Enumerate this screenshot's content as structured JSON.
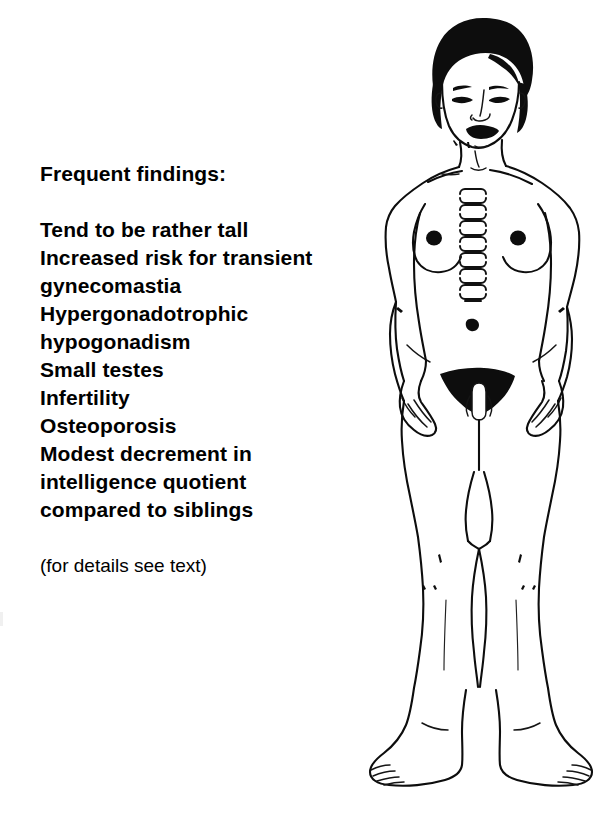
{
  "page": {
    "background_color": "#ffffff",
    "ink_color": "#0d0d0d",
    "width": 604,
    "height": 836
  },
  "findings": {
    "heading": "Frequent findings:",
    "items": [
      "Tend to be rather tall",
      "Increased risk for transient\ngynecomastia",
      "Hypergonadotrophic\nhypogonadism",
      "Small testes",
      "Infertility",
      "Osteoporosis",
      "Modest decrement in\nintelligence quotient\ncompared to siblings"
    ],
    "note": "(for details see text)"
  },
  "figure": {
    "caption": "Frontal full-body line drawing of a male patient",
    "parts": [
      "head-hair",
      "face",
      "eyebrows",
      "eyes",
      "nose",
      "lips",
      "neck",
      "clavicles",
      "shoulders",
      "chest",
      "breasts",
      "nipples",
      "sternum-markings",
      "navel",
      "arms",
      "hands",
      "pubic-hair",
      "genitalia",
      "thighs",
      "knees",
      "calves",
      "ankles",
      "feet",
      "toes"
    ]
  }
}
